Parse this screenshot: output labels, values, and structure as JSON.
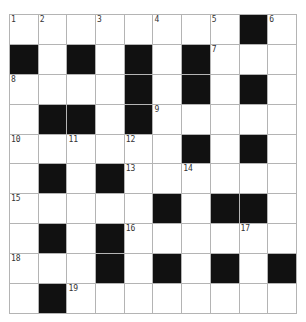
{
  "puzzle": {
    "rows": 10,
    "cols": 10,
    "grid": [
      [
        "1",
        "2",
        "",
        "3",
        "",
        "4",
        "",
        "5",
        "#",
        "6"
      ],
      [
        "#",
        "",
        "#",
        "",
        "#",
        "",
        "#",
        "7",
        "",
        ""
      ],
      [
        "8",
        "",
        "",
        "",
        "#",
        "",
        "#",
        "",
        "#",
        ""
      ],
      [
        "",
        "#",
        "#",
        "",
        "#",
        "9",
        "",
        "",
        "",
        ""
      ],
      [
        "10",
        "",
        "11",
        "",
        "12",
        "",
        "#",
        "",
        "#",
        ""
      ],
      [
        "",
        "#",
        "",
        "#",
        "13",
        "",
        "14",
        "",
        "",
        ""
      ],
      [
        "15",
        "",
        "",
        "",
        "",
        "#",
        "",
        "#",
        "#",
        ""
      ],
      [
        "",
        "#",
        "",
        "#",
        "16",
        "",
        "",
        "",
        "17",
        ""
      ],
      [
        "18",
        "",
        "",
        "#",
        "",
        "#",
        "",
        "#",
        "",
        "#"
      ],
      [
        "",
        "#",
        "19",
        "",
        "",
        "",
        "",
        "",
        "",
        ""
      ]
    ]
  },
  "colors": {
    "black_cell": "#111111",
    "white_cell": "#ffffff",
    "grid_line": "#b4b4b4",
    "number_text": "#333333"
  }
}
